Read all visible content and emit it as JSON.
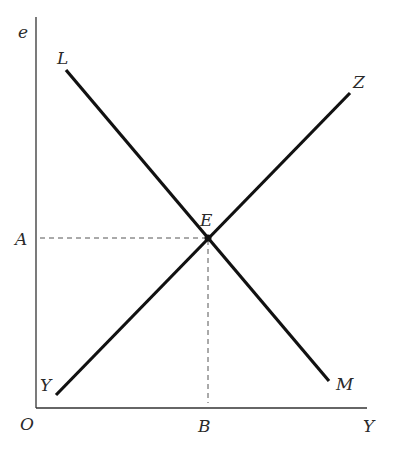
{
  "diagram": {
    "axes": {
      "y_label": "e",
      "x_label": "Y",
      "origin_label": "O"
    },
    "lines": [
      {
        "name": "LM",
        "start_label": "L",
        "end_label": "M",
        "direction": "downward-sloping"
      },
      {
        "name": "YZ",
        "start_label": "Y",
        "end_label": "Z",
        "direction": "upward-sloping"
      }
    ],
    "intersection": {
      "label": "E"
    },
    "projections": {
      "y_axis_label": "A",
      "x_axis_label": "B"
    },
    "colors": {
      "lines": "#111111",
      "axes": "#333333",
      "dashed": "#555555",
      "background": "#ffffff"
    }
  }
}
